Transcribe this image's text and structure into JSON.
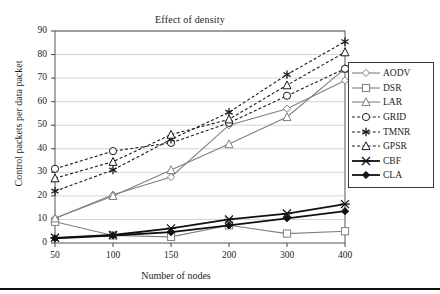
{
  "chart_data": {
    "type": "line",
    "title": "Effect of density",
    "xlabel": "Number of nodes",
    "ylabel": "Control packets per data packet",
    "categories": [
      "50",
      "100",
      "150",
      "200",
      "300",
      "400"
    ],
    "x": [
      50,
      100,
      150,
      200,
      300,
      400
    ],
    "ylim": [
      0,
      90
    ],
    "yticks": [
      "0",
      "10",
      "20",
      "30",
      "40",
      "50",
      "60",
      "70",
      "80",
      "90"
    ],
    "ytick_values": [
      0,
      10,
      20,
      30,
      40,
      50,
      60,
      70,
      80,
      90
    ],
    "grid": "horizontal",
    "legend_position": "right",
    "series": [
      {
        "name": "AODV",
        "marker": "diamond-open",
        "linestyle": "solid",
        "color": "#808080",
        "values": [
          10.5,
          20.5,
          28.0,
          50.0,
          57.0,
          69.0
        ]
      },
      {
        "name": "DSR",
        "marker": "square-open",
        "linestyle": "solid",
        "color": "#808080",
        "values": [
          9.0,
          3.2,
          2.6,
          7.5,
          4.0,
          5.0
        ]
      },
      {
        "name": "LAR",
        "marker": "triangle-open",
        "linestyle": "solid",
        "color": "#808080",
        "values": [
          10.5,
          20.0,
          31.0,
          42.0,
          53.5,
          74.0
        ]
      },
      {
        "name": "GRID",
        "marker": "circle-open",
        "linestyle": "dashed",
        "color": "#1a1a1a",
        "values": [
          31.5,
          39.0,
          42.5,
          51.0,
          62.5,
          74.0
        ]
      },
      {
        "name": "TMNR",
        "marker": "asterisk",
        "linestyle": "dashed",
        "color": "#1a1a1a",
        "values": [
          22.0,
          31.0,
          44.0,
          55.5,
          71.5,
          85.5
        ]
      },
      {
        "name": "GPSR",
        "marker": "triangle-open",
        "linestyle": "dashed",
        "color": "#1a1a1a",
        "values": [
          27.5,
          34.5,
          46.0,
          52.5,
          67.0,
          81.0
        ]
      },
      {
        "name": "CBF",
        "marker": "x-cross",
        "linestyle": "solid",
        "color": "#111111",
        "values": [
          2.2,
          3.4,
          6.2,
          10.0,
          12.5,
          16.5
        ]
      },
      {
        "name": "CLA",
        "marker": "diamond-filled",
        "linestyle": "solid",
        "color": "#111111",
        "values": [
          2.0,
          3.2,
          4.6,
          7.5,
          10.5,
          13.5
        ]
      }
    ]
  },
  "legend": {
    "items": [
      {
        "label": "AODV"
      },
      {
        "label": "DSR"
      },
      {
        "label": "LAR"
      },
      {
        "label": "GRID"
      },
      {
        "label": "TMNR"
      },
      {
        "label": "GPSR"
      },
      {
        "label": "CBF"
      },
      {
        "label": "CLA"
      }
    ]
  }
}
